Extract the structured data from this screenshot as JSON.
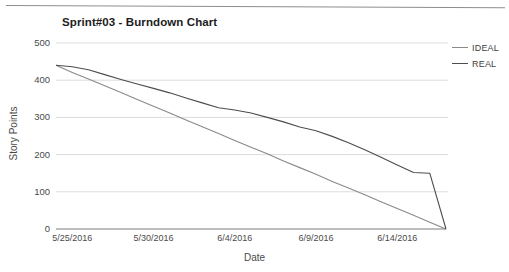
{
  "chart_data": {
    "type": "line",
    "title": "Sprint#03 - Burndown Chart",
    "xlabel": "Date",
    "ylabel": "Story Points",
    "grid": true,
    "legend_position": "right",
    "ylim": [
      0,
      500
    ],
    "yticks": [
      0,
      100,
      200,
      300,
      400,
      500
    ],
    "xticks": [
      "5/25/2016",
      "5/30/2016",
      "6/4/2016",
      "6/9/2016",
      "6/14/2016"
    ],
    "x": [
      "5/24/2016",
      "5/25/2016",
      "5/26/2016",
      "5/27/2016",
      "5/28/2016",
      "5/29/2016",
      "5/30/2016",
      "5/31/2016",
      "6/1/2016",
      "6/2/2016",
      "6/3/2016",
      "6/4/2016",
      "6/5/2016",
      "6/6/2016",
      "6/7/2016",
      "6/8/2016",
      "6/9/2016",
      "6/10/2016",
      "6/11/2016",
      "6/12/2016",
      "6/13/2016",
      "6/14/2016",
      "6/15/2016",
      "6/16/2016",
      "6/17/2016"
    ],
    "series": [
      {
        "name": "IDEAL",
        "color": "#8a8a8a",
        "values": [
          440,
          421,
          403,
          385,
          367,
          348,
          330,
          312,
          293,
          275,
          257,
          238,
          220,
          202,
          183,
          165,
          147,
          128,
          110,
          92,
          73,
          55,
          37,
          18,
          0
        ]
      },
      {
        "name": "REAL",
        "color": "#4d4d4d",
        "values": [
          440,
          436,
          428,
          415,
          402,
          390,
          378,
          366,
          352,
          339,
          326,
          320,
          312,
          300,
          288,
          274,
          264,
          249,
          232,
          213,
          193,
          172,
          152,
          150,
          0
        ]
      }
    ]
  },
  "legend": {
    "items": [
      {
        "label": "IDEAL",
        "color": "#8a8a8a"
      },
      {
        "label": "REAL",
        "color": "#4d4d4d"
      }
    ]
  }
}
